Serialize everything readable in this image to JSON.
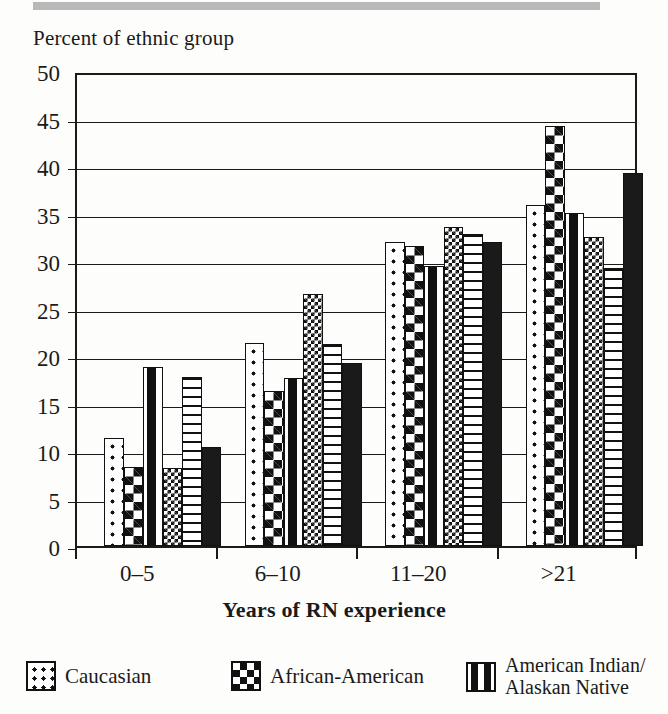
{
  "chart_data": {
    "type": "bar",
    "title": "",
    "ylabel": "Percent of ethnic group",
    "xlabel": "Years of RN experience",
    "categories": [
      "0–5",
      "6–10",
      "11–20",
      ">21"
    ],
    "ylim": [
      0,
      50
    ],
    "yticks": [
      0,
      5,
      10,
      15,
      20,
      25,
      30,
      35,
      40,
      45,
      50
    ],
    "grid": true,
    "legend_position": "bottom",
    "series": [
      {
        "name": "Caucasian",
        "pattern": "dots",
        "values": [
          11.4,
          21.4,
          32.0,
          35.9
        ]
      },
      {
        "name": "African-American",
        "pattern": "checkerboard",
        "values": [
          8.3,
          16.3,
          31.6,
          44.2
        ]
      },
      {
        "name": "American Indian/ Alaskan Native",
        "pattern": "dashes",
        "values": [
          18.8,
          17.7,
          29.5,
          35.1
        ]
      },
      {
        "name": "Series 4",
        "pattern": "fine-checkerboard",
        "values": [
          8.2,
          26.5,
          33.6,
          32.5
        ]
      },
      {
        "name": "Series 5",
        "pattern": "horizontal-lines",
        "values": [
          17.8,
          21.3,
          32.8,
          29.3
        ]
      },
      {
        "name": "Series 6",
        "pattern": "solid",
        "values": [
          10.4,
          19.3,
          32.0,
          39.3
        ]
      }
    ]
  },
  "axis": {
    "y_title": "Percent of ethnic group",
    "x_title": "Years of RN experience",
    "y_tick_labels": [
      "0",
      "5",
      "10",
      "15",
      "20",
      "25",
      "30",
      "35",
      "40",
      "45",
      "50"
    ],
    "x_tick_labels": [
      "0–5",
      "6–10",
      "11–20",
      ">21"
    ]
  },
  "legend": {
    "items": [
      {
        "label": "Caucasian",
        "swatch": "dots-swatch-icon"
      },
      {
        "label": "African-American",
        "swatch": "checkerboard-swatch-icon"
      },
      {
        "label": "American Indian/ Alaskan Native",
        "swatch": "dashes-swatch-icon"
      }
    ]
  },
  "colors": {
    "ink": "#1a1a1a",
    "paper": "#fdfdfb",
    "band": "#b9b9b9"
  }
}
